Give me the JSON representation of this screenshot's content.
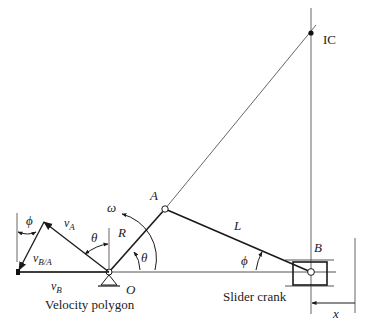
{
  "figure": {
    "colors": {
      "ink": "#1a1a1a",
      "thin": "#555555",
      "background": "#ffffff"
    }
  },
  "labels": {
    "ic": "IC",
    "point_a": "A",
    "point_b": "B",
    "point_o": "O",
    "crank_length": "R",
    "rod_length": "L",
    "omega": "ω",
    "theta_crank": "θ",
    "theta_polygon": "θ",
    "phi_mechanism": "ϕ",
    "phi_polygon": "ϕ",
    "v_a": "v",
    "v_a_sub": "A",
    "v_ba": "v",
    "v_ba_sub": "B/A",
    "v_b": "v",
    "v_b_sub": "B",
    "x": "x",
    "caption_polygon": "Velocity polygon",
    "caption_mechanism": "Slider crank"
  }
}
